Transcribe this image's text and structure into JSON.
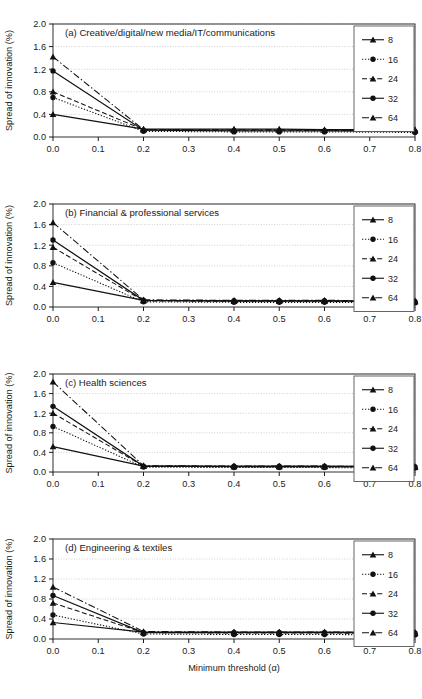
{
  "figure": {
    "xlabel": "Minimum threshold (α)",
    "ylabel": "Spread of innovation (%)"
  },
  "chart_data": [
    {
      "type": "line",
      "title": "(a) Creative/digital/new media/IT/communications",
      "xlabel": "Minimum threshold (α)",
      "ylabel": "Spread of innovation (%)",
      "xlim": [
        0.0,
        0.8
      ],
      "ylim": [
        0.0,
        2.0
      ],
      "xticks": [
        0.0,
        0.1,
        0.2,
        0.3,
        0.4,
        0.5,
        0.6,
        0.7,
        0.8
      ],
      "xticklabels": [
        "0.0",
        "0.1",
        "0.2",
        "0.3",
        "0.4",
        "0.5",
        "0.6",
        "0.7",
        "0.8"
      ],
      "yticks": [
        0.0,
        0.4,
        0.8,
        1.2,
        1.6,
        2.0
      ],
      "yticklabels": [
        "0.0",
        "0.4",
        "0.8",
        "1.2",
        "1.6",
        "2.0"
      ],
      "grid": "horizontal-dotted",
      "legend_position": "top-right",
      "x": [
        0.0,
        0.2,
        0.4,
        0.5,
        0.6,
        0.8
      ],
      "series": [
        {
          "name": "8",
          "marker": "triangle",
          "linestyle": "solid",
          "values": [
            0.4,
            0.14,
            0.14,
            0.14,
            0.13,
            0.13
          ]
        },
        {
          "name": "16",
          "marker": "circle",
          "linestyle": "dotted",
          "values": [
            0.7,
            0.1,
            0.09,
            0.09,
            0.09,
            0.08
          ]
        },
        {
          "name": "24",
          "marker": "triangle",
          "linestyle": "dashed",
          "values": [
            0.8,
            0.13,
            0.12,
            0.12,
            0.12,
            0.11
          ]
        },
        {
          "name": "32",
          "marker": "circle",
          "linestyle": "solid",
          "values": [
            1.17,
            0.12,
            0.11,
            0.11,
            0.11,
            0.1
          ]
        },
        {
          "name": "64",
          "marker": "triangle",
          "linestyle": "dashdot",
          "values": [
            1.42,
            0.13,
            0.13,
            0.13,
            0.12,
            0.12
          ]
        }
      ]
    },
    {
      "type": "line",
      "title": "(b) Financial & professional services",
      "xlabel": "Minimum threshold (α)",
      "ylabel": "Spread of innovation (%)",
      "xlim": [
        0.0,
        0.8
      ],
      "ylim": [
        0.0,
        2.0
      ],
      "xticks": [
        0.0,
        0.1,
        0.2,
        0.3,
        0.4,
        0.5,
        0.6,
        0.7,
        0.8
      ],
      "xticklabels": [
        "0.0",
        "0.1",
        "0.2",
        "0.3",
        "0.4",
        "0.5",
        "0.6",
        "0.7",
        "0.8"
      ],
      "yticks": [
        0.0,
        0.4,
        0.8,
        1.2,
        1.6,
        2.0
      ],
      "yticklabels": [
        "0.0",
        "0.4",
        "0.8",
        "1.2",
        "1.6",
        "2.0"
      ],
      "grid": "horizontal-dotted",
      "legend_position": "top-right",
      "x": [
        0.0,
        0.2,
        0.4,
        0.5,
        0.6,
        0.8
      ],
      "series": [
        {
          "name": "8",
          "marker": "triangle",
          "linestyle": "solid",
          "values": [
            0.48,
            0.13,
            0.12,
            0.12,
            0.12,
            0.11
          ]
        },
        {
          "name": "16",
          "marker": "circle",
          "linestyle": "dotted",
          "values": [
            0.86,
            0.1,
            0.09,
            0.09,
            0.09,
            0.08
          ]
        },
        {
          "name": "24",
          "marker": "triangle",
          "linestyle": "dashed",
          "values": [
            1.16,
            0.12,
            0.11,
            0.11,
            0.11,
            0.1
          ]
        },
        {
          "name": "32",
          "marker": "circle",
          "linestyle": "solid",
          "values": [
            1.3,
            0.13,
            0.12,
            0.12,
            0.12,
            0.11
          ]
        },
        {
          "name": "64",
          "marker": "triangle",
          "linestyle": "dashdot",
          "values": [
            1.64,
            0.14,
            0.13,
            0.13,
            0.13,
            0.12
          ]
        }
      ]
    },
    {
      "type": "line",
      "title": "(c) Health sciences",
      "xlabel": "Minimum threshold (α)",
      "ylabel": "Spread of innovation (%)",
      "xlim": [
        0.0,
        0.8
      ],
      "ylim": [
        0.0,
        2.0
      ],
      "xticks": [
        0.0,
        0.1,
        0.2,
        0.3,
        0.4,
        0.5,
        0.6,
        0.7,
        0.8
      ],
      "xticklabels": [
        "0.0",
        "0.1",
        "0.2",
        "0.3",
        "0.4",
        "0.5",
        "0.6",
        "0.7",
        "0.8"
      ],
      "yticks": [
        0.0,
        0.4,
        0.8,
        1.2,
        1.6,
        2.0
      ],
      "yticklabels": [
        "0.0",
        "0.4",
        "0.8",
        "1.2",
        "1.6",
        "2.0"
      ],
      "grid": "horizontal-dotted",
      "legend_position": "top-right",
      "x": [
        0.0,
        0.2,
        0.4,
        0.5,
        0.6,
        0.8
      ],
      "series": [
        {
          "name": "8",
          "marker": "triangle",
          "linestyle": "solid",
          "values": [
            0.52,
            0.12,
            0.11,
            0.11,
            0.11,
            0.1
          ]
        },
        {
          "name": "16",
          "marker": "circle",
          "linestyle": "dotted",
          "values": [
            0.93,
            0.1,
            0.09,
            0.09,
            0.09,
            0.08
          ]
        },
        {
          "name": "24",
          "marker": "triangle",
          "linestyle": "dashed",
          "values": [
            1.2,
            0.12,
            0.11,
            0.11,
            0.11,
            0.1
          ]
        },
        {
          "name": "32",
          "marker": "circle",
          "linestyle": "solid",
          "values": [
            1.34,
            0.12,
            0.12,
            0.12,
            0.12,
            0.11
          ]
        },
        {
          "name": "64",
          "marker": "triangle",
          "linestyle": "dashdot",
          "values": [
            1.84,
            0.13,
            0.12,
            0.12,
            0.12,
            0.11
          ]
        }
      ]
    },
    {
      "type": "line",
      "title": "(d) Engineering & textiles",
      "xlabel": "Minimum threshold (α)",
      "ylabel": "Spread of innovation (%)",
      "xlim": [
        0.0,
        0.8
      ],
      "ylim": [
        0.0,
        2.0
      ],
      "xticks": [
        0.0,
        0.1,
        0.2,
        0.3,
        0.4,
        0.5,
        0.6,
        0.7,
        0.8
      ],
      "xticklabels": [
        "0.0",
        "0.1",
        "0.2",
        "0.3",
        "0.4",
        "0.5",
        "0.6",
        "0.7",
        "0.8"
      ],
      "yticks": [
        0.0,
        0.4,
        0.8,
        1.2,
        1.6,
        2.0
      ],
      "yticklabels": [
        "0.0",
        "0.4",
        "0.8",
        "1.2",
        "1.6",
        "2.0"
      ],
      "grid": "horizontal-dotted",
      "legend_position": "top-right",
      "x": [
        0.0,
        0.2,
        0.4,
        0.5,
        0.6,
        0.8
      ],
      "series": [
        {
          "name": "8",
          "marker": "triangle",
          "linestyle": "solid",
          "values": [
            0.33,
            0.14,
            0.14,
            0.14,
            0.14,
            0.13
          ]
        },
        {
          "name": "16",
          "marker": "circle",
          "linestyle": "dotted",
          "values": [
            0.48,
            0.1,
            0.09,
            0.09,
            0.09,
            0.08
          ]
        },
        {
          "name": "24",
          "marker": "triangle",
          "linestyle": "dashed",
          "values": [
            0.72,
            0.13,
            0.12,
            0.12,
            0.12,
            0.11
          ]
        },
        {
          "name": "32",
          "marker": "circle",
          "linestyle": "solid",
          "values": [
            0.87,
            0.13,
            0.13,
            0.13,
            0.13,
            0.12
          ]
        },
        {
          "name": "64",
          "marker": "triangle",
          "linestyle": "dashdot",
          "values": [
            1.04,
            0.15,
            0.14,
            0.14,
            0.14,
            0.13
          ]
        }
      ]
    }
  ]
}
